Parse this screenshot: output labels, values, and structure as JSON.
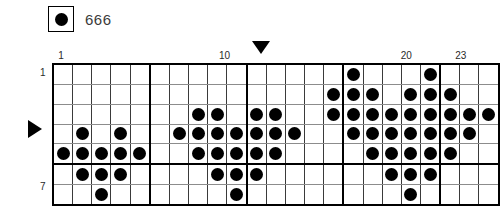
{
  "legend": {
    "symbol": "filled-circle",
    "label": "666",
    "symbol_color": "#000000"
  },
  "chart_data": {
    "type": "heatmap",
    "title": "",
    "xlabel": "",
    "ylabel": "",
    "columns": 23,
    "rows": 7,
    "grid": true,
    "group_size": 5,
    "col_tick_labels": [
      {
        "col": 1,
        "text": "1"
      },
      {
        "col": 10,
        "text": "10"
      },
      {
        "col": 20,
        "text": "20"
      },
      {
        "col": 23,
        "text": "23"
      }
    ],
    "row_tick_labels": [
      {
        "row": 1,
        "text": "1"
      },
      {
        "row": 7,
        "text": "7"
      }
    ],
    "markers": [
      {
        "name": "column-marker",
        "icon": "triangle-down",
        "col": 12
      },
      {
        "name": "row-marker",
        "icon": "triangle-right",
        "row": 4
      }
    ],
    "legend_entries": [
      {
        "symbol": "filled-circle",
        "label": "666"
      }
    ],
    "cells": [
      {
        "row": 1,
        "filled": [
          16,
          20
        ]
      },
      {
        "row": 2,
        "filled": [
          15,
          16,
          17,
          19,
          20,
          21
        ]
      },
      {
        "row": 3,
        "filled": [
          8,
          9,
          11,
          12,
          15,
          16,
          17,
          18,
          19,
          20,
          21,
          22,
          23
        ]
      },
      {
        "row": 4,
        "filled": [
          2,
          4,
          7,
          8,
          9,
          10,
          11,
          12,
          13,
          16,
          17,
          18,
          19,
          20,
          21,
          22
        ]
      },
      {
        "row": 5,
        "filled": [
          1,
          2,
          3,
          4,
          5,
          8,
          9,
          10,
          11,
          12,
          17,
          18,
          19,
          20,
          21
        ]
      },
      {
        "row": 6,
        "filled": [
          2,
          3,
          4,
          9,
          10,
          11,
          18,
          19,
          20
        ]
      },
      {
        "row": 7,
        "filled": [
          3,
          10,
          19
        ]
      }
    ]
  }
}
